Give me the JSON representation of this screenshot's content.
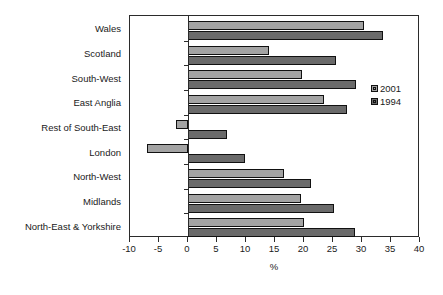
{
  "chart_data": {
    "type": "bar",
    "orientation": "horizontal",
    "title": "",
    "subtitle": "",
    "xlabel": "%",
    "ylabel": "",
    "xlim": [
      -10,
      40
    ],
    "xticks": [
      -10,
      -5,
      0,
      5,
      10,
      15,
      20,
      25,
      30,
      35,
      40
    ],
    "xticklabels": [
      "-10",
      "-5",
      "0",
      "5",
      "10",
      "15",
      "20",
      "25",
      "30",
      "35",
      "40"
    ],
    "grid": false,
    "legend_position": "right",
    "categories": [
      "Wales",
      "Scotland",
      "South-West",
      "East Anglia",
      "Rest of South-East",
      "London",
      "North-West",
      "Midlands",
      "North-East & Yorkshire"
    ],
    "series": [
      {
        "name": "2001",
        "color": "#a3a3a3",
        "values": [
          30.3,
          14.0,
          19.7,
          23.4,
          -2.1,
          -7.1,
          16.6,
          19.5,
          20.0
        ]
      },
      {
        "name": "1994",
        "color": "#6a6a6a",
        "values": [
          33.6,
          25.5,
          29.0,
          27.4,
          6.7,
          9.8,
          21.2,
          25.2,
          28.8
        ]
      }
    ],
    "annotations": []
  },
  "legend": {
    "entries": [
      {
        "label": "2001",
        "swatch": "light-gray-swatch"
      },
      {
        "label": "1994",
        "swatch": "dark-gray-swatch"
      }
    ]
  },
  "axis": {
    "x_title": "%"
  },
  "colors": {
    "series_2001": "#a3a3a3",
    "series_1994": "#6a6a6a",
    "axis": "#2b2b2b",
    "bar_border": "#111111",
    "background": "#ffffff"
  }
}
